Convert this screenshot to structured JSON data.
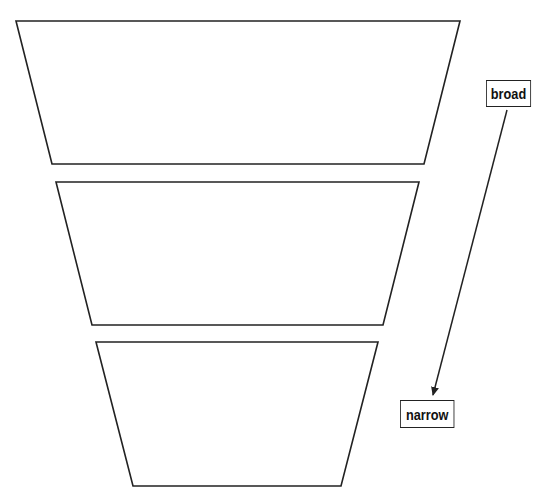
{
  "diagram": {
    "type": "funnel",
    "stroke_color": "#222222",
    "levels": [
      {
        "name": "level-1",
        "points": [
          [
            16,
            21
          ],
          [
            460,
            21
          ],
          [
            424,
            164
          ],
          [
            52,
            164
          ]
        ]
      },
      {
        "name": "level-2",
        "points": [
          [
            56,
            182
          ],
          [
            419,
            182
          ],
          [
            383,
            325
          ],
          [
            92,
            325
          ]
        ]
      },
      {
        "name": "level-3",
        "points": [
          [
            96,
            342
          ],
          [
            378,
            342
          ],
          [
            341,
            486
          ],
          [
            133,
            486
          ]
        ]
      }
    ],
    "labels": {
      "top": "broad",
      "bottom": "narrow"
    },
    "arrow": {
      "from": [
        507,
        110
      ],
      "to": [
        433,
        395
      ]
    }
  }
}
